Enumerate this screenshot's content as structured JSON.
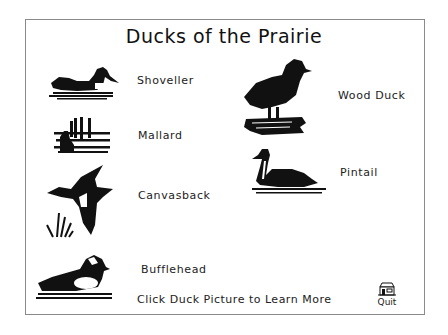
{
  "title": "Ducks of the Prairie",
  "ducks": [
    {
      "name": "Shoveller",
      "icon": "shoveller-duck-picture"
    },
    {
      "name": "Mallard",
      "icon": "mallard-duck-picture"
    },
    {
      "name": "Canvasback",
      "icon": "canvasback-duck-picture"
    },
    {
      "name": "Bufflehead",
      "icon": "bufflehead-duck-picture"
    },
    {
      "name": "Wood Duck",
      "icon": "wood-duck-picture"
    },
    {
      "name": "Pintail",
      "icon": "pintail-duck-picture"
    }
  ],
  "footer": {
    "instruction": "Click Duck Picture to Learn More",
    "quit_label": "Quit",
    "quit_icon": "house-icon"
  },
  "colors": {
    "ink": "#111111",
    "frame": "#8a8a8a",
    "background": "#ffffff"
  }
}
